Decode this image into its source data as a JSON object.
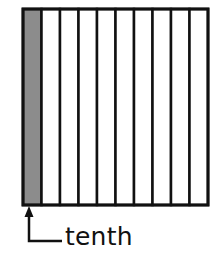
{
  "diagram": {
    "title": "",
    "model": {
      "type": "tenths-strip",
      "total_parts": 10,
      "shaded_parts": 1,
      "shaded_index": 0,
      "orientation": "vertical-strips"
    },
    "colors": {
      "shade": "#8c8c8c",
      "line": "#111111",
      "background": "#ffffff"
    },
    "annotation": {
      "label": "tenth",
      "pointer": "arrow-up-to-first-strip"
    }
  }
}
